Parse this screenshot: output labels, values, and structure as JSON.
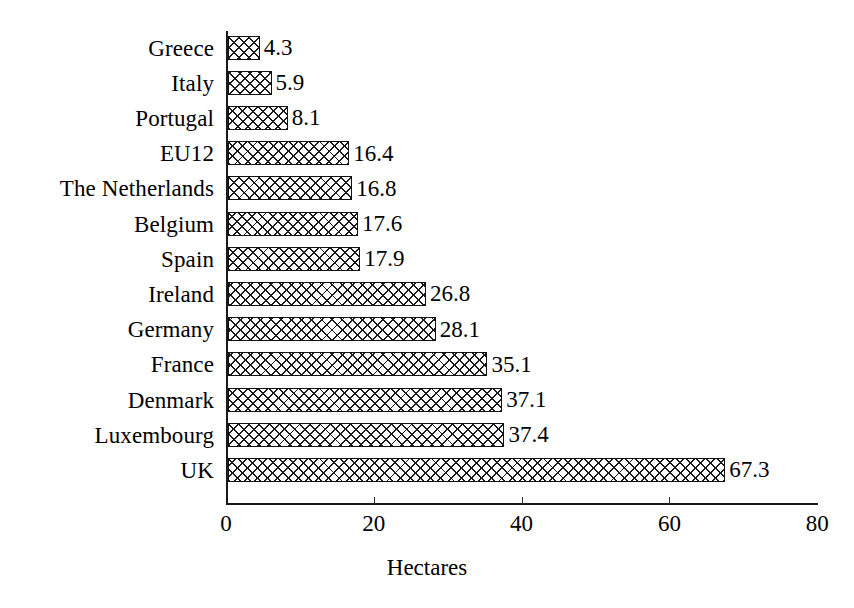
{
  "chart_data": {
    "type": "bar",
    "orientation": "horizontal",
    "title": "",
    "xlabel": "Hectares",
    "ylabel": "",
    "xlim": [
      0,
      80
    ],
    "xticks": [
      0,
      20,
      40,
      60,
      80
    ],
    "xtick_labels": [
      "0",
      "20",
      "40",
      "60",
      "80"
    ],
    "grid": false,
    "legend": false,
    "categories": [
      "Greece",
      "Italy",
      "Portugal",
      "EU12",
      "The Netherlands",
      "Belgium",
      "Spain",
      "Ireland",
      "Germany",
      "France",
      "Denmark",
      "Luxembourg",
      "UK"
    ],
    "values": [
      4.3,
      5.9,
      8.1,
      16.4,
      16.8,
      17.6,
      17.9,
      26.8,
      28.1,
      35.1,
      37.1,
      37.4,
      67.3
    ],
    "value_labels": [
      "4.3",
      "5.9",
      "8.1",
      "16.4",
      "16.8",
      "17.6",
      "17.9",
      "26.8",
      "28.1",
      "35.1",
      "37.1",
      "37.4",
      "67.3"
    ],
    "bar_fill": "crosshatch",
    "bar_edge_color": "#111111",
    "bar_face_color": "#ffffff",
    "background_color": "#ffffff"
  }
}
